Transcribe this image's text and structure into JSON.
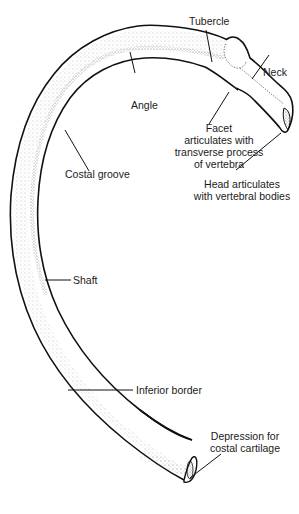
{
  "figure": {
    "labels": {
      "tubercle": "Tubercle",
      "neck": "Neck",
      "angle": "Angle",
      "facet": [
        "Facet",
        "articulates with",
        "transverse process",
        "of vertebra"
      ],
      "costal_groove": "Costal groove",
      "head": [
        "Head articulates",
        "with vertebral bodies"
      ],
      "shaft": "Shaft",
      "inferior_border": "Inferior border",
      "depression": [
        "Depression for",
        "costal cartilage"
      ]
    },
    "colors": {
      "outline": "#111111",
      "stipple": "#777777",
      "background": "#ffffff"
    }
  }
}
